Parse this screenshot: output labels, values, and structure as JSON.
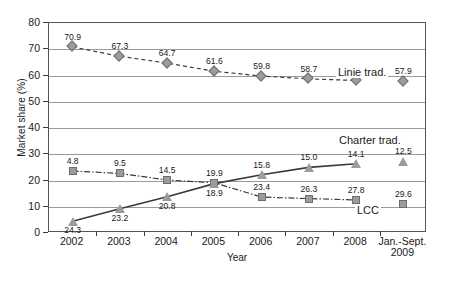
{
  "chart_data": {
    "type": "line",
    "title": "",
    "xlabel": "Year",
    "ylabel": "Market share (%)",
    "ylim": [
      0,
      80
    ],
    "ytick_step": 10,
    "yticks": [
      "0",
      "10",
      "20",
      "30",
      "40",
      "50",
      "60",
      "70",
      "80"
    ],
    "grid": true,
    "legend_position": "inline-annotations",
    "categories": [
      "2002",
      "2003",
      "2004",
      "2005",
      "2006",
      "2007",
      "2008",
      "Jan.-Sept. 2009"
    ],
    "xtick_labels": [
      {
        "line1": "2002",
        "line2": ""
      },
      {
        "line1": "2003",
        "line2": ""
      },
      {
        "line1": "2004",
        "line2": ""
      },
      {
        "line1": "2005",
        "line2": ""
      },
      {
        "line1": "2006",
        "line2": ""
      },
      {
        "line1": "2007",
        "line2": ""
      },
      {
        "line1": "2008",
        "line2": ""
      },
      {
        "line1": "Jan.-Sept.",
        "line2": "2009"
      }
    ],
    "series": [
      {
        "name": "Linie trad.",
        "marker": "diamond",
        "line_style": "dashed",
        "values": [
          70.9,
          67.3,
          64.7,
          61.6,
          59.8,
          58.7,
          58.1,
          57.9
        ],
        "labels": [
          "70.9",
          "67.3",
          "64.7",
          "61.6",
          "59.8",
          "58.7",
          "58.1",
          "57.9"
        ],
        "label_position": "above",
        "last_point_connected": false,
        "annotation": "Linie trad."
      },
      {
        "name": "LCC",
        "marker": "square",
        "line_style": "dash-dot",
        "values": [
          23.6,
          22.7,
          20.2,
          19.1,
          13.7,
          13.1,
          12.6,
          11.0
        ],
        "labels": [
          "4.8",
          "9.5",
          "14.5",
          "19.9",
          "23.4",
          "26.3",
          "27.8",
          "29.6"
        ],
        "label_position": "above",
        "last_point_connected": false,
        "annotation": "LCC"
      },
      {
        "name": "Charter trad.",
        "marker": "triangle",
        "line_style": "solid",
        "values": [
          4.5,
          9.2,
          13.8,
          18.8,
          22.2,
          25.0,
          26.4,
          27.3
        ],
        "labels": [
          "24.3",
          "23.2",
          "20.8",
          "18.9",
          "15.8",
          "15.0",
          "14.1",
          "12.5"
        ],
        "label_position": "mixed",
        "last_point_connected": false,
        "annotation": "Charter trad."
      }
    ],
    "annotations": [
      {
        "text": "Linie trad.",
        "series": "Linie trad."
      },
      {
        "text": "Charter trad.",
        "series": "Charter trad."
      },
      {
        "text": "LCC",
        "series": "LCC"
      }
    ],
    "colors": {
      "marker_fill": "#9c9c9c",
      "marker_stroke": "#6d6d6d",
      "line": "#3a3a3a",
      "grid": "#9a9a9a",
      "axis": "#555555",
      "text": "#1a1a1a"
    }
  }
}
